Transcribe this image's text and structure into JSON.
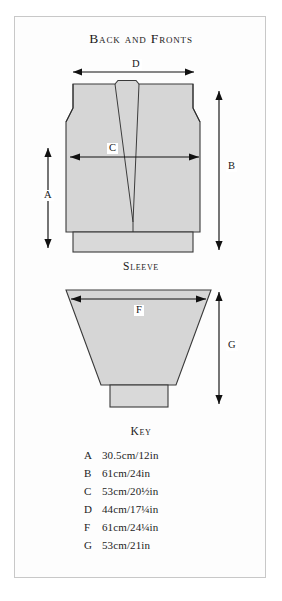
{
  "document": {
    "type": "sewing-pattern-measurement-diagram"
  },
  "sections": {
    "back_and_fronts": {
      "title": "Back and Fronts",
      "dimension_labels": {
        "width_top": "D",
        "width_chest": "C",
        "height_left": "A",
        "height_right": "B"
      }
    },
    "sleeve": {
      "title": "Sleeve",
      "dimension_labels": {
        "width_top": "F",
        "height_right": "G"
      }
    },
    "key": {
      "title": "Key",
      "entries": [
        {
          "letter": "A",
          "value": "30.5cm/12in"
        },
        {
          "letter": "B",
          "value": "61cm/24in"
        },
        {
          "letter": "C",
          "value": "53cm/20½in"
        },
        {
          "letter": "D",
          "value": "44cm/17¼in"
        },
        {
          "letter": "F",
          "value": "61cm/24¼in"
        },
        {
          "letter": "G",
          "value": "53cm/21in"
        }
      ]
    }
  },
  "colors": {
    "piece_fill": "#d6d6d6",
    "piece_stroke": "#3a3a3a",
    "frame_border": "#c8c8c8",
    "page_background": "#ffffff",
    "text": "#1c1c1c"
  }
}
